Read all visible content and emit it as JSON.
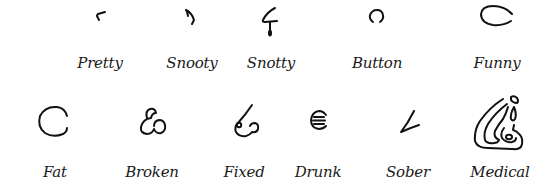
{
  "figure": {
    "rows": [
      {
        "items": [
          {
            "id": "pretty",
            "label": "Pretty",
            "icon": "pretty-nose-icon"
          },
          {
            "id": "snooty",
            "label": "Snooty",
            "icon": "snooty-nose-icon"
          },
          {
            "id": "snotty",
            "label": "Snotty",
            "icon": "snotty-nose-icon"
          },
          {
            "id": "button",
            "label": "Button",
            "icon": "button-nose-icon"
          },
          {
            "id": "funny",
            "label": "Funny",
            "icon": "funny-nose-icon"
          }
        ]
      },
      {
        "items": [
          {
            "id": "fat",
            "label": "Fat",
            "icon": "fat-nose-icon"
          },
          {
            "id": "broken",
            "label": "Broken",
            "icon": "broken-nose-icon"
          },
          {
            "id": "fixed",
            "label": "Fixed",
            "icon": "fixed-nose-icon"
          },
          {
            "id": "drunk",
            "label": "Drunk",
            "icon": "drunk-nose-icon"
          },
          {
            "id": "sober",
            "label": "Sober",
            "icon": "sober-nose-icon"
          },
          {
            "id": "medical",
            "label": "Medical",
            "icon": "medical-nose-icon"
          }
        ]
      }
    ]
  },
  "colors": {
    "ink": "#111111",
    "background": "#ffffff"
  }
}
